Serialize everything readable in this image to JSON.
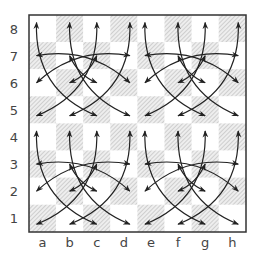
{
  "diagram": {
    "type": "chessboard",
    "files": [
      "a",
      "b",
      "c",
      "d",
      "e",
      "f",
      "g",
      "h"
    ],
    "ranks": [
      "8",
      "7",
      "6",
      "5",
      "4",
      "3",
      "2",
      "1"
    ],
    "light_square_color": "#ffffff",
    "dark_square_style": "hatched",
    "border_color": "#333333",
    "arrow_color": "#222222",
    "quadrants": [
      "a5-d8",
      "e5-h8",
      "a1-d4",
      "e1-h4"
    ],
    "arrow_pattern": "interlocking curved double-headed arrows in each 4x4 quadrant"
  }
}
